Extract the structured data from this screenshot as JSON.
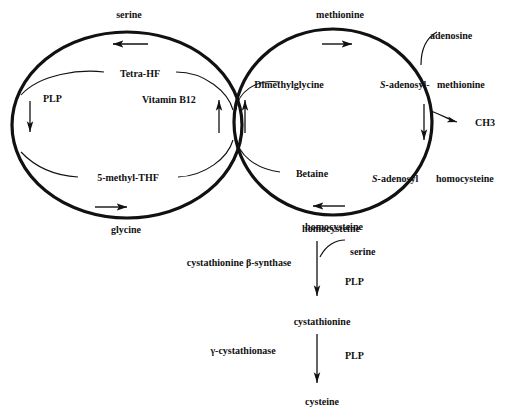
{
  "diagram": {
    "stroke_color": "#111111",
    "background": "#ffffff"
  },
  "folate_cycle": {
    "name": "folate-cycle",
    "top_label": "serine",
    "bottom_label": "glycine",
    "inner_top_label": "Tetra-HF",
    "inner_bottom_label": "5-methyl-THF",
    "cofactor_left": "PLP",
    "cofactor_right": "Vitamin B12"
  },
  "methionine_cycle": {
    "name": "methionine-cycle",
    "top_label": "methionine",
    "bottom_label": "homocysteine",
    "right_upper_label_italic": "S-",
    "right_upper_label_a": "adenosyl-",
    "right_upper_label_b": "methionine",
    "right_lower_label_italic": "S-",
    "right_lower_label_a": "adenosyl",
    "right_lower_label_b": "homocysteine",
    "inner_top_label": "Dimethylglycine",
    "inner_bottom_label": "Betaine",
    "branch_in_label": "adenosine",
    "branch_out_label": "CH3"
  },
  "transsulfuration": {
    "name": "transsulfuration-pathway",
    "node_start": "homocysteine",
    "node_mid": "cystathionine",
    "node_end": "cysteine",
    "enzyme_1": "cystathionine β-synthase",
    "enzyme_2": "γ-cystathionase",
    "cofactor_1": "PLP",
    "cofactor_2": "PLP",
    "substrate_1": "serine"
  }
}
